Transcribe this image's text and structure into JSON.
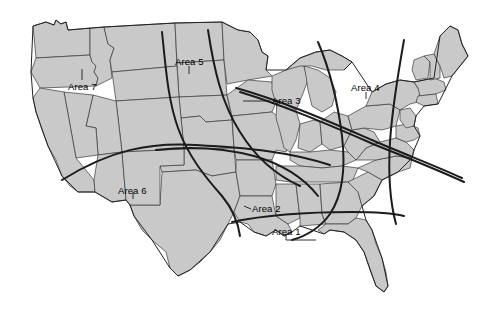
{
  "figure": {
    "kind": "us-territory-map",
    "background_color": "#ffffff",
    "land_fill_color": "#c9c9c9",
    "state_border_color": "#3a3a3a",
    "boundary_curve_color": "#1c1c1c",
    "label_color": "#000000"
  },
  "labels": [
    {
      "id": "area-7",
      "text": "Area 7",
      "x": 68,
      "y": 82
    },
    {
      "id": "area-5",
      "text": "Area 5",
      "x": 175,
      "y": 57
    },
    {
      "id": "area-3",
      "text": "Area 3",
      "x": 272,
      "y": 96
    },
    {
      "id": "area-4",
      "text": "Area 4",
      "x": 351,
      "y": 83
    },
    {
      "id": "area-6",
      "text": "Area 6",
      "x": 118,
      "y": 186
    },
    {
      "id": "area-2",
      "text": "Area 2",
      "x": 252,
      "y": 204
    },
    {
      "id": "area-1",
      "text": "Area 1",
      "x": 272,
      "y": 227
    }
  ],
  "leader_lines": [
    {
      "id": "leader-area-7",
      "d": "M 82 80 L 82 69"
    },
    {
      "id": "leader-area-3",
      "d": "M 270 101 L 243 101"
    },
    {
      "id": "leader-area-6",
      "d": "M 133 192 L 133 199"
    },
    {
      "id": "leader-area-2",
      "d": "M 251 209 L 244 206"
    },
    {
      "id": "leader-area-1",
      "d": "M 302 232 L 312 238"
    }
  ],
  "boundary_curves": [
    {
      "id": "curve-a",
      "note": "west-to-east arc across southern plains into gulf"
    },
    {
      "id": "curve-b",
      "note": "north-south arc through central plains"
    },
    {
      "id": "curve-c",
      "note": "northern plains down through texas"
    },
    {
      "id": "curve-d",
      "note": "great lakes diagonal to northeast"
    },
    {
      "id": "curve-e",
      "note": "appalachian arc from lakes to gulf coast"
    },
    {
      "id": "curve-f",
      "note": "atlantic seaboard arc"
    },
    {
      "id": "curve-g",
      "note": "gulf coast line"
    }
  ]
}
